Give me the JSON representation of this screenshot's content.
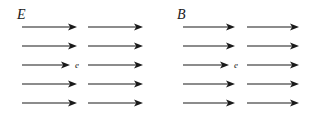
{
  "figure": {
    "background_color": "#ffffff",
    "stroke_color": "#1a1a1a",
    "width": 309,
    "height": 119,
    "panels": [
      {
        "id": "electric-field-panel",
        "field_label": "E",
        "field_label_meaning": "electric-field",
        "particle_label": "e",
        "particle_label_meaning": "electron",
        "row_count": 5,
        "arrows_per_row": 2,
        "arrow_direction": "right",
        "rows": [
          {
            "y": 27,
            "arrows": [
              {
                "x1": 22,
                "x2": 77
              },
              {
                "x1": 88,
                "x2": 143
              }
            ]
          },
          {
            "y": 46,
            "arrows": [
              {
                "x1": 22,
                "x2": 77
              },
              {
                "x1": 88,
                "x2": 143
              }
            ]
          },
          {
            "y": 65,
            "arrows": [
              {
                "x1": 22,
                "x2": 70
              },
              {
                "x1": 88,
                "x2": 143
              }
            ]
          },
          {
            "y": 84,
            "arrows": [
              {
                "x1": 22,
                "x2": 77
              },
              {
                "x1": 88,
                "x2": 143
              }
            ]
          },
          {
            "y": 103,
            "arrows": [
              {
                "x1": 22,
                "x2": 77
              },
              {
                "x1": 88,
                "x2": 143
              }
            ]
          }
        ],
        "particle_position": {
          "x": 75,
          "y": 61
        }
      },
      {
        "id": "magnetic-field-panel",
        "field_label": "B",
        "field_label_meaning": "magnetic-field",
        "particle_label": "e",
        "particle_label_meaning": "electron",
        "row_count": 5,
        "arrows_per_row": 2,
        "arrow_direction": "right",
        "rows": [
          {
            "y": 27,
            "arrows": [
              {
                "x1": 28,
                "x2": 80
              },
              {
                "x1": 92,
                "x2": 144
              }
            ]
          },
          {
            "y": 46,
            "arrows": [
              {
                "x1": 28,
                "x2": 80
              },
              {
                "x1": 92,
                "x2": 144
              }
            ]
          },
          {
            "y": 65,
            "arrows": [
              {
                "x1": 28,
                "x2": 74
              },
              {
                "x1": 92,
                "x2": 144
              }
            ]
          },
          {
            "y": 84,
            "arrows": [
              {
                "x1": 28,
                "x2": 80
              },
              {
                "x1": 92,
                "x2": 144
              }
            ]
          },
          {
            "y": 103,
            "arrows": [
              {
                "x1": 28,
                "x2": 80
              },
              {
                "x1": 92,
                "x2": 144
              }
            ]
          }
        ],
        "particle_position": {
          "x": 79,
          "y": 61
        }
      }
    ]
  }
}
